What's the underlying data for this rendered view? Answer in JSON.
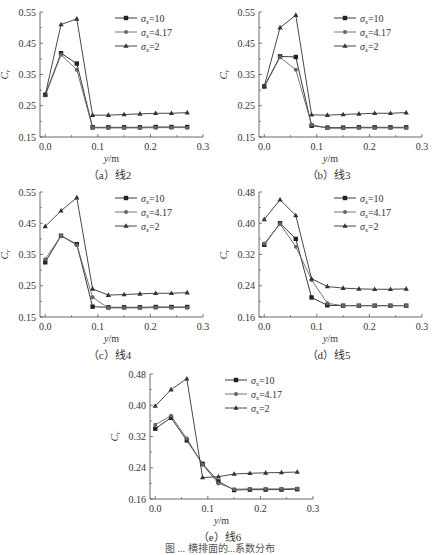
{
  "figure_caption_partial": "图 ... 横排面的...系数分布",
  "legend": [
    {
      "label": "σx=10",
      "sym": "σ",
      "sub": "x",
      "val": "=10",
      "marker": "square"
    },
    {
      "label": "σx=4.17",
      "sym": "σ",
      "sub": "x",
      "val": "=4.17",
      "marker": "circle"
    },
    {
      "label": "σx=2",
      "sym": "σ",
      "sub": "x",
      "val": "=2",
      "marker": "triangle"
    }
  ],
  "xlabel": "y/m",
  "ylabel": "Cr",
  "chart_data": [
    {
      "type": "line",
      "title": "(a) 线2",
      "xlabel": "y/m",
      "ylabel": "Cr",
      "xlim": [
        -0.01,
        0.3
      ],
      "ylim": [
        0.15,
        0.55
      ],
      "xticks": [
        "0.0",
        "0.1",
        "0.2",
        "0.3"
      ],
      "yticks": [
        "0.15",
        "0.25",
        "0.35",
        "0.45",
        "0.55"
      ],
      "x": [
        0.0,
        0.03,
        0.06,
        0.09,
        0.12,
        0.15,
        0.18,
        0.21,
        0.24,
        0.27
      ],
      "series": [
        {
          "name": "σx=10",
          "values": [
            0.285,
            0.418,
            0.385,
            0.181,
            0.181,
            0.181,
            0.181,
            0.182,
            0.182,
            0.182
          ]
        },
        {
          "name": "σx=4.17",
          "values": [
            0.283,
            0.413,
            0.365,
            0.179,
            0.179,
            0.179,
            0.179,
            0.18,
            0.18,
            0.18
          ]
        },
        {
          "name": "σx=2",
          "values": [
            0.285,
            0.51,
            0.528,
            0.22,
            0.22,
            0.222,
            0.224,
            0.226,
            0.226,
            0.228
          ]
        }
      ]
    },
    {
      "type": "line",
      "title": "(b) 线3",
      "xlabel": "y/m",
      "ylabel": "Cr",
      "xlim": [
        -0.01,
        0.3
      ],
      "ylim": [
        0.15,
        0.55
      ],
      "xticks": [
        "0.0",
        "0.1",
        "0.2",
        "0.3"
      ],
      "yticks": [
        "0.15",
        "0.25",
        "0.35",
        "0.45",
        "0.55"
      ],
      "x": [
        0.0,
        0.03,
        0.06,
        0.09,
        0.12,
        0.15,
        0.18,
        0.21,
        0.24,
        0.27
      ],
      "series": [
        {
          "name": "σx=10",
          "values": [
            0.312,
            0.408,
            0.406,
            0.186,
            0.18,
            0.18,
            0.181,
            0.181,
            0.181,
            0.181
          ]
        },
        {
          "name": "σx=4.17",
          "values": [
            0.31,
            0.405,
            0.365,
            0.19,
            0.178,
            0.178,
            0.179,
            0.179,
            0.179,
            0.179
          ]
        },
        {
          "name": "σx=2",
          "values": [
            0.312,
            0.5,
            0.54,
            0.221,
            0.22,
            0.222,
            0.224,
            0.226,
            0.226,
            0.228
          ]
        }
      ]
    },
    {
      "type": "line",
      "title": "(c) 线4",
      "xlabel": "y/m",
      "ylabel": "Cr",
      "xlim": [
        -0.01,
        0.3
      ],
      "ylim": [
        0.15,
        0.55
      ],
      "xticks": [
        "0.0",
        "0.1",
        "0.2",
        "0.3"
      ],
      "yticks": [
        "0.15",
        "0.25",
        "0.35",
        "0.45",
        "0.55"
      ],
      "x": [
        0.0,
        0.03,
        0.06,
        0.09,
        0.12,
        0.15,
        0.18,
        0.21,
        0.24,
        0.27
      ],
      "series": [
        {
          "name": "σx=10",
          "values": [
            0.325,
            0.41,
            0.383,
            0.183,
            0.181,
            0.181,
            0.181,
            0.182,
            0.182,
            0.182
          ]
        },
        {
          "name": "σx=4.17",
          "values": [
            0.335,
            0.41,
            0.38,
            0.213,
            0.179,
            0.179,
            0.179,
            0.18,
            0.18,
            0.18
          ]
        },
        {
          "name": "σx=2",
          "values": [
            0.44,
            0.49,
            0.532,
            0.24,
            0.22,
            0.222,
            0.224,
            0.226,
            0.226,
            0.228
          ]
        }
      ]
    },
    {
      "type": "line",
      "title": "(d) 线5",
      "xlabel": "y/m",
      "ylabel": "Cr",
      "xlim": [
        -0.01,
        0.3
      ],
      "ylim": [
        0.16,
        0.48
      ],
      "xticks": [
        "0.0",
        "0.1",
        "0.2",
        "0.3"
      ],
      "yticks": [
        "0.16",
        "0.24",
        "0.32",
        "0.40",
        "0.48"
      ],
      "x": [
        0.0,
        0.03,
        0.06,
        0.09,
        0.12,
        0.15,
        0.18,
        0.21,
        0.24,
        0.27
      ],
      "series": [
        {
          "name": "σx=10",
          "values": [
            0.345,
            0.4,
            0.36,
            0.21,
            0.19,
            0.189,
            0.189,
            0.189,
            0.189,
            0.189
          ]
        },
        {
          "name": "σx=4.17",
          "values": [
            0.348,
            0.398,
            0.34,
            0.255,
            0.195,
            0.189,
            0.189,
            0.189,
            0.189,
            0.189
          ]
        },
        {
          "name": "σx=2",
          "values": [
            0.41,
            0.46,
            0.42,
            0.258,
            0.238,
            0.234,
            0.232,
            0.231,
            0.231,
            0.232
          ]
        }
      ]
    },
    {
      "type": "line",
      "title": "(e) 线6",
      "xlabel": "y/m",
      "ylabel": "Cr",
      "xlim": [
        -0.01,
        0.3
      ],
      "ylim": [
        0.16,
        0.48
      ],
      "xticks": [
        "0.0",
        "0.1",
        "0.2",
        "0.3"
      ],
      "yticks": [
        "0.16",
        "0.24",
        "0.32",
        "0.40",
        "0.48"
      ],
      "x": [
        0.0,
        0.03,
        0.06,
        0.09,
        0.12,
        0.15,
        0.18,
        0.21,
        0.24,
        0.27
      ],
      "series": [
        {
          "name": "σx=10",
          "values": [
            0.34,
            0.368,
            0.31,
            0.25,
            0.205,
            0.183,
            0.184,
            0.184,
            0.184,
            0.185
          ]
        },
        {
          "name": "σx=4.17",
          "values": [
            0.35,
            0.373,
            0.315,
            0.248,
            0.2,
            0.185,
            0.186,
            0.186,
            0.186,
            0.187
          ]
        },
        {
          "name": "σx=2",
          "values": [
            0.398,
            0.44,
            0.468,
            0.215,
            0.217,
            0.224,
            0.226,
            0.227,
            0.228,
            0.229
          ]
        }
      ]
    }
  ],
  "panels": [
    {
      "caption": "（a）线2",
      "left": 0,
      "top": 0
    },
    {
      "caption": "（b）线3",
      "left": 219,
      "top": 0
    },
    {
      "caption": "（c）线4",
      "left": 0,
      "top": 180
    },
    {
      "caption": "（d）线5",
      "left": 219,
      "top": 180
    },
    {
      "caption": "（e）线6",
      "left": 110,
      "top": 362
    }
  ]
}
